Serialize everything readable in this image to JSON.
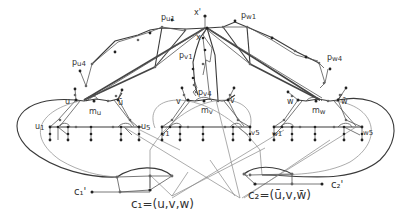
{
  "diagram": {
    "labels": {
      "x_prime": "x'",
      "x": "x",
      "p_u1": "p",
      "p_u1_sub": "u1",
      "p_u4": "p",
      "p_u4_sub": "u4",
      "p_w1": "p",
      "p_w1_sub": "w1",
      "p_w4": "p",
      "p_w4_sub": "w4",
      "p_v1": "p",
      "p_v1_sub": "v1",
      "p_v4": "p",
      "p_v4_sub": "v4",
      "u": "u",
      "u_bar": "ū",
      "m_u": "m",
      "m_u_sub": "u",
      "u1": "u",
      "u1_sub": "1",
      "u5": "u",
      "u5_sub": "5",
      "v": "v",
      "v_bar": "v̄",
      "m_v": "m",
      "m_v_sub": "v",
      "v1": "v",
      "v1_sub": "1",
      "v5": "v",
      "v5_sub": "5",
      "w": "w",
      "w_bar": "w̄",
      "m_w": "m",
      "m_w_sub": "w",
      "w1": "w",
      "w1_sub": "1",
      "w5": "w",
      "w5_sub": "5",
      "c1_prime": "c₁'",
      "c2_prime": "c₂'",
      "c1_def": "c₁=(u,v,w)",
      "c2_def": "c₂=(ū,v,w̄)"
    },
    "colors": {
      "background": "#ffffff",
      "edge": "#555555",
      "node": "#222222",
      "text": "#333333"
    }
  }
}
